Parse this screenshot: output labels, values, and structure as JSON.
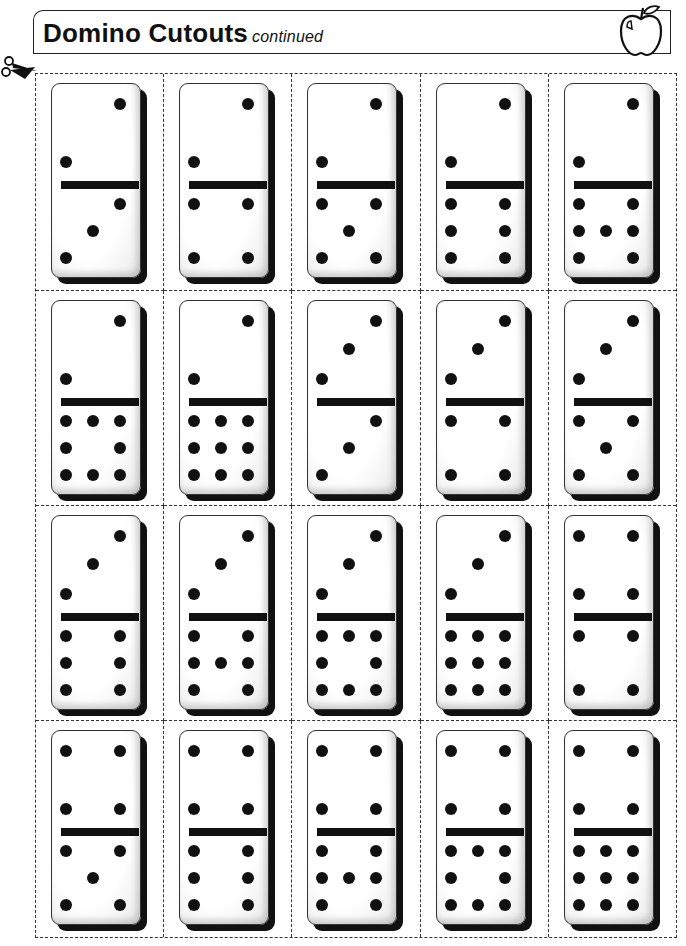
{
  "header": {
    "title": "Domino Cutouts",
    "subtitle": "continued",
    "icon": "apple-icon"
  },
  "cut_marker_icon": "scissors-icon",
  "dominoes": [
    {
      "top": 2,
      "bottom": 3
    },
    {
      "top": 2,
      "bottom": 4
    },
    {
      "top": 2,
      "bottom": 5
    },
    {
      "top": 2,
      "bottom": 6
    },
    {
      "top": 2,
      "bottom": 7
    },
    {
      "top": 2,
      "bottom": 8
    },
    {
      "top": 2,
      "bottom": 9
    },
    {
      "top": 3,
      "bottom": 3
    },
    {
      "top": 3,
      "bottom": 4
    },
    {
      "top": 3,
      "bottom": 5
    },
    {
      "top": 3,
      "bottom": 6
    },
    {
      "top": 3,
      "bottom": 7
    },
    {
      "top": 3,
      "bottom": 8
    },
    {
      "top": 3,
      "bottom": 9
    },
    {
      "top": 4,
      "bottom": 4
    },
    {
      "top": 4,
      "bottom": 5
    },
    {
      "top": 4,
      "bottom": 6
    },
    {
      "top": 4,
      "bottom": 7
    },
    {
      "top": 4,
      "bottom": 8
    },
    {
      "top": 4,
      "bottom": 9
    }
  ],
  "grid": {
    "columns": 5,
    "rows": 4
  }
}
